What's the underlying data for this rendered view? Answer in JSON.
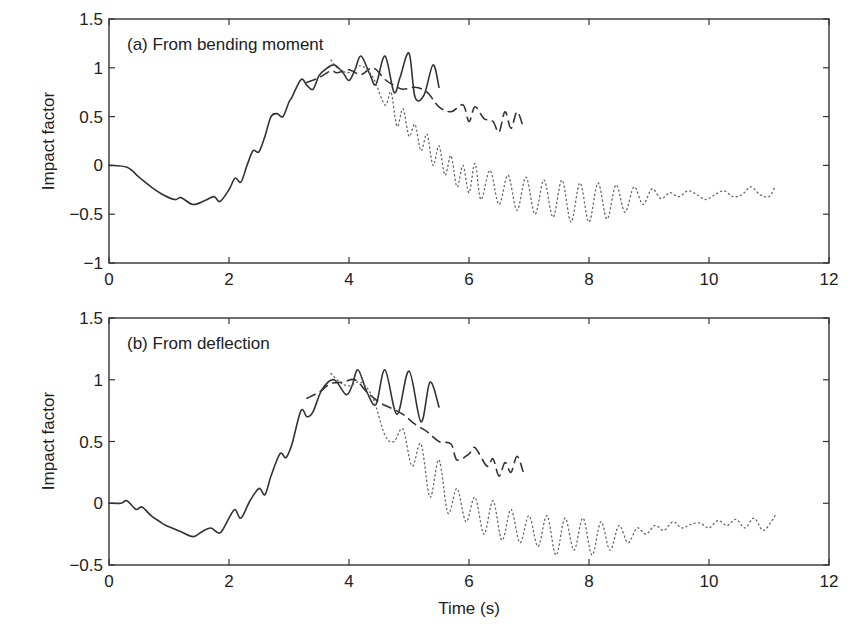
{
  "chart_data": [
    {
      "type": "line",
      "panel_label": "(a)  From bending moment",
      "xlabel": "",
      "ylabel": "Impact factor",
      "xlim": [
        0,
        12
      ],
      "ylim": [
        -1,
        1.5
      ],
      "xticks": [
        0,
        2,
        4,
        6,
        8,
        10,
        12
      ],
      "yticks": [
        -1,
        -0.5,
        0,
        0.5,
        1,
        1.5
      ],
      "ytick_labels": [
        "−1",
        "−0.5",
        "0",
        "0.5",
        "1",
        "1.5"
      ],
      "grid": false,
      "series": [
        {
          "name": "solid",
          "style": "solid",
          "x": [
            0,
            0.3,
            0.5,
            0.7,
            0.9,
            1.1,
            1.2,
            1.4,
            1.6,
            1.75,
            1.85,
            2.0,
            2.1,
            2.2,
            2.3,
            2.4,
            2.5,
            2.6,
            2.7,
            2.8,
            2.9,
            3.0,
            3.05,
            3.2,
            3.3,
            3.4,
            3.5,
            3.6,
            3.75,
            3.9,
            4.0,
            4.1,
            4.2,
            4.35,
            4.45,
            4.6,
            4.75,
            4.85,
            5.0,
            5.1,
            5.25,
            5.4,
            5.5
          ],
          "y": [
            0,
            -0.02,
            -0.12,
            -0.22,
            -0.3,
            -0.35,
            -0.33,
            -0.4,
            -0.36,
            -0.32,
            -0.37,
            -0.25,
            -0.13,
            -0.17,
            0.0,
            0.15,
            0.14,
            0.3,
            0.5,
            0.53,
            0.5,
            0.65,
            0.7,
            0.88,
            0.82,
            0.78,
            0.92,
            0.98,
            1.03,
            0.95,
            0.87,
            0.98,
            1.12,
            0.93,
            0.83,
            1.12,
            0.75,
            0.9,
            1.15,
            0.7,
            0.72,
            1.03,
            0.8
          ]
        },
        {
          "name": "dashed",
          "style": "dashed",
          "x": [
            3.3,
            3.5,
            3.7,
            3.8,
            4.0,
            4.2,
            4.4,
            4.6,
            4.75,
            4.9,
            5.1,
            5.3,
            5.5,
            5.7,
            5.9,
            6.0,
            6.1,
            6.25,
            6.4,
            6.5,
            6.6,
            6.7,
            6.8,
            6.9
          ],
          "y": [
            0.85,
            0.9,
            0.97,
            0.95,
            0.98,
            0.93,
            1.0,
            0.88,
            0.82,
            0.78,
            0.8,
            0.75,
            0.6,
            0.55,
            0.62,
            0.45,
            0.6,
            0.48,
            0.45,
            0.34,
            0.55,
            0.38,
            0.55,
            0.4
          ]
        },
        {
          "name": "dotted",
          "style": "dotted",
          "x": [
            3.7,
            3.8,
            4.0,
            4.2,
            4.4,
            4.6,
            4.7,
            4.8,
            4.9,
            5.0,
            5.1,
            5.2,
            5.3,
            5.4,
            5.5,
            5.6,
            5.7,
            5.8,
            5.9,
            6.0,
            6.1,
            6.2,
            6.35,
            6.5,
            6.65,
            6.8,
            6.95,
            7.1,
            7.25,
            7.4,
            7.55,
            7.7,
            7.85,
            8.0,
            8.15,
            8.3,
            8.45,
            8.6,
            8.75,
            8.9,
            9.05,
            9.2,
            9.35,
            9.5,
            9.65,
            9.8,
            9.95,
            10.1,
            10.25,
            10.4,
            10.55,
            10.7,
            10.85,
            11.0,
            11.1
          ],
          "y": [
            1.08,
            1.0,
            0.95,
            1.02,
            0.9,
            0.62,
            0.75,
            0.4,
            0.58,
            0.3,
            0.42,
            0.15,
            0.32,
            0.0,
            0.2,
            -0.1,
            0.1,
            -0.22,
            0.0,
            -0.28,
            0.02,
            -0.35,
            -0.05,
            -0.4,
            -0.1,
            -0.46,
            -0.12,
            -0.5,
            -0.15,
            -0.53,
            -0.15,
            -0.58,
            -0.18,
            -0.58,
            -0.18,
            -0.55,
            -0.2,
            -0.48,
            -0.22,
            -0.4,
            -0.24,
            -0.34,
            -0.28,
            -0.32,
            -0.26,
            -0.3,
            -0.35,
            -0.3,
            -0.26,
            -0.32,
            -0.3,
            -0.22,
            -0.3,
            -0.32,
            -0.22
          ]
        }
      ]
    },
    {
      "type": "line",
      "panel_label": "(b) From deflection",
      "xlabel": "Time (s)",
      "ylabel": "Impact factor",
      "xlim": [
        0,
        12
      ],
      "ylim": [
        -0.5,
        1.5
      ],
      "xticks": [
        0,
        2,
        4,
        6,
        8,
        10,
        12
      ],
      "yticks": [
        -0.5,
        0,
        0.5,
        1,
        1.5
      ],
      "ytick_labels": [
        "−0.5",
        "0",
        "0.5",
        "1",
        "1.5"
      ],
      "grid": false,
      "series": [
        {
          "name": "solid",
          "style": "solid",
          "x": [
            0,
            0.2,
            0.3,
            0.45,
            0.55,
            0.7,
            0.85,
            0.95,
            1.05,
            1.2,
            1.4,
            1.55,
            1.7,
            1.85,
            2.0,
            2.1,
            2.2,
            2.35,
            2.5,
            2.6,
            2.7,
            2.85,
            2.95,
            3.05,
            3.2,
            3.3,
            3.4,
            3.55,
            3.75,
            3.95,
            4.05,
            4.15,
            4.3,
            4.45,
            4.6,
            4.8,
            5.0,
            5.2,
            5.35,
            5.5
          ],
          "y": [
            0,
            0,
            0.02,
            -0.05,
            -0.03,
            -0.1,
            -0.15,
            -0.18,
            -0.2,
            -0.23,
            -0.27,
            -0.23,
            -0.2,
            -0.24,
            -0.12,
            -0.05,
            -0.12,
            0.02,
            0.12,
            0.07,
            0.22,
            0.4,
            0.37,
            0.48,
            0.75,
            0.7,
            0.74,
            0.92,
            1.0,
            0.88,
            0.95,
            1.08,
            0.9,
            0.8,
            1.08,
            0.72,
            1.07,
            0.66,
            0.98,
            0.78
          ]
        },
        {
          "name": "dashed",
          "style": "dashed",
          "x": [
            3.3,
            3.5,
            3.7,
            3.9,
            4.1,
            4.3,
            4.5,
            4.7,
            4.9,
            5.1,
            5.3,
            5.5,
            5.7,
            5.8,
            6.0,
            6.1,
            6.3,
            6.4,
            6.5,
            6.6,
            6.7,
            6.8,
            6.9
          ],
          "y": [
            0.85,
            0.9,
            0.97,
            0.98,
            1.0,
            0.9,
            0.82,
            0.77,
            0.72,
            0.64,
            0.58,
            0.5,
            0.48,
            0.35,
            0.4,
            0.45,
            0.3,
            0.36,
            0.22,
            0.33,
            0.25,
            0.38,
            0.26
          ]
        },
        {
          "name": "dotted",
          "style": "dotted",
          "x": [
            3.7,
            3.85,
            4.0,
            4.2,
            4.4,
            4.6,
            4.75,
            4.9,
            5.05,
            5.2,
            5.35,
            5.5,
            5.65,
            5.8,
            5.95,
            6.1,
            6.25,
            6.4,
            6.55,
            6.7,
            6.85,
            7.0,
            7.15,
            7.3,
            7.45,
            7.6,
            7.75,
            7.9,
            8.05,
            8.2,
            8.35,
            8.5,
            8.65,
            8.8,
            8.95,
            9.1,
            9.25,
            9.4,
            9.55,
            9.7,
            9.85,
            10.0,
            10.15,
            10.3,
            10.45,
            10.6,
            10.75,
            10.9,
            11.05,
            11.1
          ],
          "y": [
            1.05,
            0.98,
            0.95,
            0.98,
            0.85,
            0.55,
            0.5,
            0.6,
            0.3,
            0.48,
            0.05,
            0.35,
            -0.08,
            0.12,
            -0.15,
            0.05,
            -0.25,
            0.02,
            -0.3,
            -0.05,
            -0.32,
            -0.1,
            -0.35,
            -0.1,
            -0.42,
            -0.12,
            -0.38,
            -0.12,
            -0.42,
            -0.15,
            -0.38,
            -0.18,
            -0.32,
            -0.2,
            -0.25,
            -0.18,
            -0.22,
            -0.15,
            -0.2,
            -0.17,
            -0.16,
            -0.2,
            -0.14,
            -0.18,
            -0.13,
            -0.2,
            -0.12,
            -0.22,
            -0.14,
            -0.1
          ]
        }
      ]
    }
  ]
}
